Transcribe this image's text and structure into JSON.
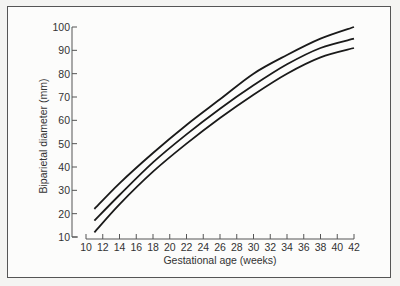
{
  "chart_data": {
    "type": "line",
    "title": "",
    "xlabel": "Gestational age (weeks)",
    "ylabel": "Biparietal diameter (mm)",
    "xlim": [
      10,
      42
    ],
    "ylim": [
      10,
      100
    ],
    "xticks": [
      10,
      12,
      14,
      16,
      18,
      20,
      22,
      24,
      26,
      28,
      30,
      32,
      34,
      36,
      38,
      40,
      42
    ],
    "yticks": [
      10,
      20,
      30,
      40,
      50,
      60,
      70,
      80,
      90,
      100
    ],
    "grid": false,
    "legend": null,
    "x": [
      11,
      14,
      18,
      22,
      26,
      30,
      34,
      38,
      42
    ],
    "series": [
      {
        "name": "upper",
        "values": [
          22,
          33,
          46,
          58,
          69,
          80,
          88,
          95,
          100
        ]
      },
      {
        "name": "middle",
        "values": [
          17,
          28,
          42,
          54,
          65,
          75,
          84,
          91,
          95
        ]
      },
      {
        "name": "lower",
        "values": [
          12,
          24,
          38,
          50,
          61,
          71,
          80,
          87,
          91
        ]
      }
    ]
  },
  "colors": {
    "line": "#1a1a1a",
    "axis": "#555555",
    "frame": "#555555"
  }
}
